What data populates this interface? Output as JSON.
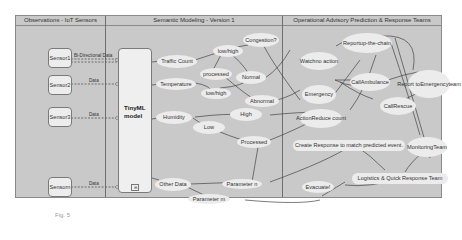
{
  "lanes": [
    {
      "title": "Observations - IoT Sensors"
    },
    {
      "title": "Semantic Modeling - Version 1"
    },
    {
      "title": "Operational Advisory Prediction & Response Teams"
    }
  ],
  "sensors": [
    {
      "line1": "Sensor",
      "line2": "1",
      "edge_label": "Bi-Directional Data"
    },
    {
      "line1": "Sensor",
      "line2": "2",
      "edge_label": "Data"
    },
    {
      "line1": "Sensor",
      "line2": "3",
      "edge_label": "Data"
    },
    {
      "line1": "Sensor",
      "line2": "n",
      "edge_label": "Data"
    }
  ],
  "model": {
    "line1": "TinyML",
    "line2": "model",
    "icon": "⊞"
  },
  "semantic_nodes": {
    "traffic_count": "Traffic Count",
    "temperature": "Temperature",
    "humidity": "Humidity",
    "other_data": "Other Data",
    "lowhigh_1": "low/high",
    "lowhigh_2": "low/high",
    "processed_1": "processed",
    "processed_2": "Processed",
    "congestion": "Congestion?",
    "normal": "Normal",
    "abnormal": "Abnormal",
    "high": "High",
    "low": "Low",
    "parameter_n": "Parameter n",
    "parameter_m": "Parameter m"
  },
  "advisory_nodes": {
    "watch_l1": "Watch",
    "watch_l2": "no action",
    "report_chain_l1": "Report",
    "report_chain_l2": "up-the-chain",
    "emergency_l1": "Emergenc",
    "emergency_l2": "y",
    "call_ambulance_l1": "Call",
    "call_ambulance_l2": "Ambulance",
    "report_emergency_l1": "Report to",
    "report_emergency_l2": "Emergency",
    "report_emergency_l3": "team",
    "call_rescue_l1": "Call",
    "call_rescue_l2": "Rescue",
    "action_l1": "Action",
    "action_l2": "Reduce count",
    "create_response": "Create Response to match predicted event.",
    "monitoring_l1": "Monitoring",
    "monitoring_l2": "Team",
    "logistics": "Logistics & Quick Response Team",
    "evacuate": "Evacuate!"
  },
  "caption": "Fig. 5"
}
